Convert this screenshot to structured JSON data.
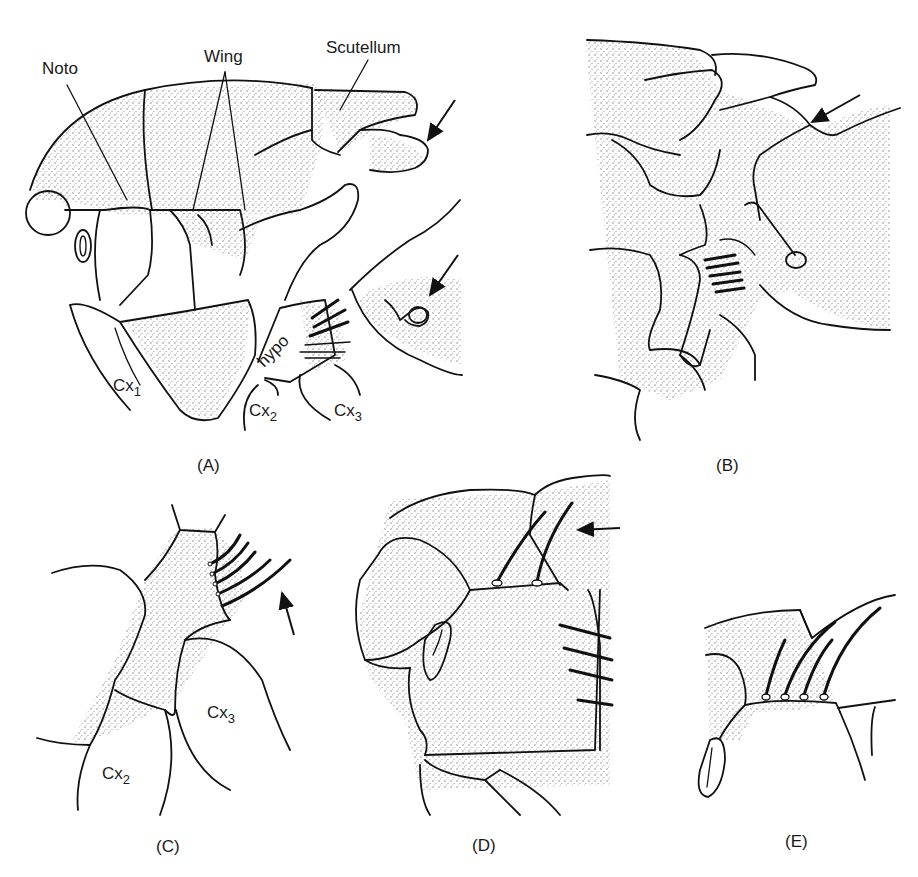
{
  "figure": {
    "ink_color": "#111111",
    "background": "#ffffff"
  },
  "panels": [
    {
      "id": "A",
      "caption": "(A)",
      "labels": {
        "noto": "Noto",
        "wing": "Wing",
        "scutellum": "Scutellum",
        "hypo": "hypo",
        "cx1": {
          "base": "Cx",
          "sub": "1"
        },
        "cx2": {
          "base": "Cx",
          "sub": "2"
        },
        "cx3": {
          "base": "Cx",
          "sub": "3"
        }
      },
      "arrows": 2
    },
    {
      "id": "B",
      "caption": "(B)",
      "arrows": 1
    },
    {
      "id": "C",
      "caption": "(C)",
      "labels": {
        "cx2": {
          "base": "Cx",
          "sub": "2"
        },
        "cx3": {
          "base": "Cx",
          "sub": "3"
        }
      },
      "arrows": 1
    },
    {
      "id": "D",
      "caption": "(D)",
      "arrows": 1
    },
    {
      "id": "E",
      "caption": "(E)",
      "arrows": 0
    }
  ]
}
